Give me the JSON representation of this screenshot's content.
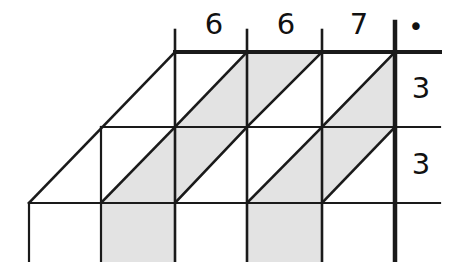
{
  "figure": {
    "colors": {
      "line": "#1a1a1a",
      "shade": "#e3e3e3",
      "background": "#ffffff"
    },
    "column_labels": [
      {
        "id": "col-label-1",
        "text": "6"
      },
      {
        "id": "col-label-2",
        "text": "6"
      },
      {
        "id": "col-label-3",
        "text": "7"
      },
      {
        "id": "col-label-dot",
        "text": "•"
      }
    ],
    "row_labels": [
      {
        "id": "row-label-1",
        "text": "3"
      },
      {
        "id": "row-label-2",
        "text": "3"
      }
    ],
    "geometry": {
      "grid_x": [
        29,
        101,
        175,
        247,
        322,
        395
      ],
      "grid_y": [
        52,
        127,
        203,
        262
      ],
      "top_rule_y": 52,
      "right_rule_x": 395,
      "shear_dx": 74,
      "rows": 3,
      "cols": 4
    },
    "shaded_cells": [
      {
        "cell": "r1c1",
        "half": "lower-right"
      },
      {
        "cell": "r1c2",
        "half": "upper-left"
      },
      {
        "cell": "r1c3",
        "half": "lower-right"
      },
      {
        "cell": "r2c0",
        "half": "lower-right"
      },
      {
        "cell": "r2c1",
        "half": "upper-left"
      },
      {
        "cell": "r2c2",
        "half": "lower-right"
      },
      {
        "cell": "r2c3",
        "half": "upper-left"
      },
      {
        "cell": "r3c1",
        "half": "full"
      },
      {
        "cell": "r3c3",
        "half": "full"
      }
    ]
  }
}
